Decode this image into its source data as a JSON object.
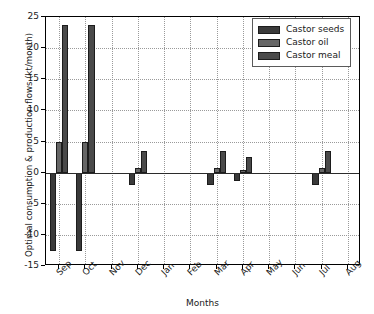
{
  "chart_data": {
    "type": "bar",
    "title": "",
    "xlabel": "Months",
    "ylabel": "Optimal consumption & production flows (kt/month)",
    "categories": [
      "Sep",
      "Oct",
      "Nov",
      "Dec",
      "Jan",
      "Feb",
      "Mar",
      "Apr",
      "May",
      "Jun",
      "Jul",
      "Aug"
    ],
    "ylim": [
      -15,
      25
    ],
    "yticks": [
      -15,
      -10,
      -5,
      0,
      5,
      10,
      15,
      20,
      25
    ],
    "ytick_labels": [
      "-15",
      "-10",
      "-5",
      "0",
      "5",
      "10",
      "15",
      "20",
      "25"
    ],
    "grid": true,
    "legend_position": "upper right",
    "series": [
      {
        "name": "Castor seeds",
        "color": "#3a3a3a",
        "values": [
          -12.6,
          -12.6,
          0,
          -2.0,
          0,
          0,
          -2.0,
          -1.4,
          0,
          0,
          -2.0,
          0
        ]
      },
      {
        "name": "Castor oil",
        "color": "#666666",
        "values": [
          5.0,
          5.0,
          0,
          0.7,
          0,
          0,
          0.7,
          0.5,
          0,
          0,
          0.7,
          0
        ]
      },
      {
        "name": "Castor meal",
        "color": "#4a4a4a",
        "values": [
          23.7,
          23.7,
          0,
          3.5,
          0,
          0,
          3.5,
          2.5,
          0,
          0,
          3.5,
          0
        ]
      }
    ]
  }
}
